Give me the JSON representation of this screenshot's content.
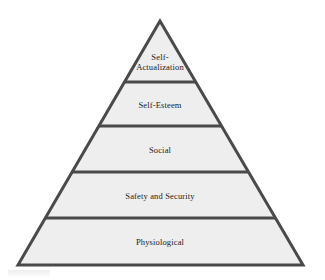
{
  "diagram": {
    "name": "maslow-hierarchy-of-needs-pyramid",
    "type": "pyramid",
    "shape": "triangle",
    "tier_count": 5,
    "background_color": "#ffffff",
    "fill_color": "#eeeeee",
    "stroke_color": "#4a4a4a",
    "text_color": "#1a1a1a",
    "apex": {
      "x": 160,
      "y": 21
    },
    "base_left": {
      "x": 18,
      "y": 265
    },
    "base_right": {
      "x": 303,
      "y": 265
    },
    "divider_y": [
      82,
      126,
      172,
      218
    ],
    "tiers": [
      {
        "index": 1,
        "position": "top",
        "label": "Self-\nActualization",
        "label_x": 160,
        "label_y": 62
      },
      {
        "index": 2,
        "position": "upper-middle",
        "label": "Self-Esteem",
        "label_x": 160,
        "label_y": 105
      },
      {
        "index": 3,
        "position": "middle",
        "label": "Social",
        "label_x": 160,
        "label_y": 150
      },
      {
        "index": 4,
        "position": "lower-middle",
        "label": "Safety and Security",
        "label_x": 160,
        "label_y": 196
      },
      {
        "index": 5,
        "position": "bottom",
        "label": "Physiological",
        "label_x": 160,
        "label_y": 242
      }
    ]
  }
}
